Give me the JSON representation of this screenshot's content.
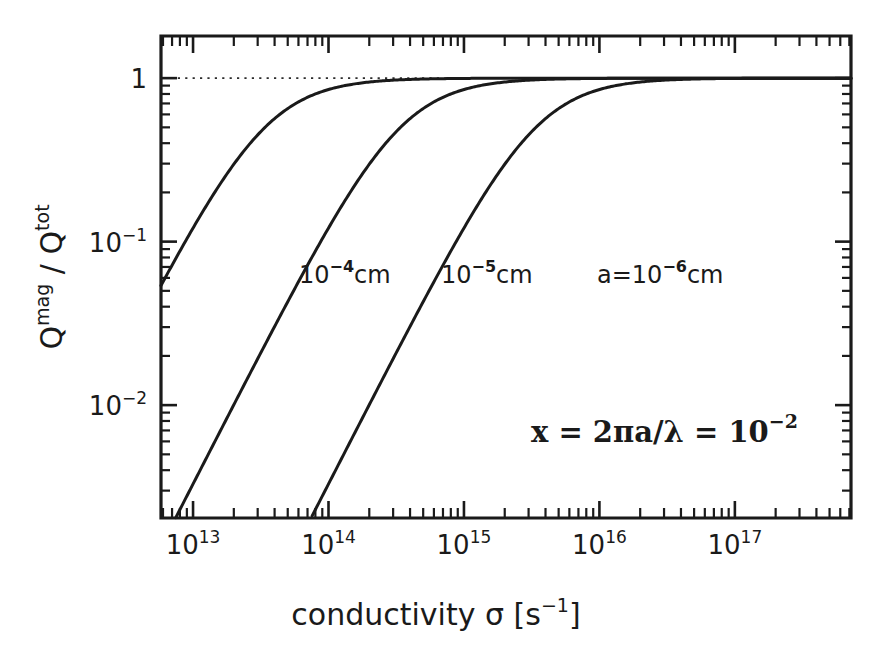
{
  "figure": {
    "background_color": "#ffffff",
    "ink_color": "#1a1a1a"
  },
  "chart_data": {
    "type": "line",
    "title": "",
    "subtitle": "",
    "xlabel": "conductivity σ [s⁻¹]",
    "ylabel": "Qᵐᵃᵍ/Qᵗᵒᵗ",
    "xscale": "log",
    "yscale": "log",
    "xlim": [
      5800000000000.0,
      7.2e+17
    ],
    "ylim": [
      0.00204,
      1.81
    ],
    "grid": false,
    "legend": "inline-curve-labels",
    "x_tick_labels": [
      "10¹³",
      "10¹⁴",
      "10¹⁵",
      "10¹⁶",
      "10¹⁷"
    ],
    "x_tick_values": [
      10000000000000.0,
      100000000000000.0,
      1000000000000000.0,
      1e+16,
      1e+17
    ],
    "y_tick_labels": [
      "1",
      "10⁻¹",
      "10⁻²"
    ],
    "y_tick_values": [
      1,
      0.1,
      0.01
    ],
    "annotations": [
      {
        "name": "unity-asymptote",
        "text": "",
        "style": "dotted-horizontal-line",
        "y": 1
      }
    ],
    "series": [
      {
        "name": "a = 10^-4 cm",
        "label": "10⁻⁴cm",
        "label_base": "10",
        "label_exponent": "-4",
        "label_unit": "cm",
        "sigma_half": 34000000000000.0,
        "x_at_ymin": 10000000000000.0,
        "color": "#1a1a1a"
      },
      {
        "name": "a = 10^-5 cm",
        "label": "10⁻⁵cm",
        "label_base": "10",
        "label_exponent": "-5",
        "label_unit": "cm",
        "sigma_half": 340000000000000.0,
        "x_at_ymin": 100000000000000.0,
        "color": "#1a1a1a"
      },
      {
        "name": "a = 10^-6 cm",
        "label": "a=10⁻⁶cm",
        "label_prefix": "a=",
        "label_base": "10",
        "label_exponent": "-6",
        "label_unit": "cm",
        "sigma_half": 3400000000000000.0,
        "x_at_ymin": 1000000000000000.0,
        "color": "#1a1a1a"
      }
    ]
  },
  "axes": {
    "x_title": {
      "text_before": "conductivity σ [s",
      "exponent": "−1",
      "text_after": "]"
    },
    "y_title": {
      "q1": "Q",
      "sup1": "mag",
      "slash": "/",
      "q2": "Q",
      "sup2": "tot"
    },
    "x_ticks": [
      {
        "base": "10",
        "exp": "13"
      },
      {
        "base": "10",
        "exp": "14"
      },
      {
        "base": "10",
        "exp": "15"
      },
      {
        "base": "10",
        "exp": "16"
      },
      {
        "base": "10",
        "exp": "17"
      }
    ],
    "y_ticks": [
      {
        "base": "1",
        "exp": ""
      },
      {
        "base": "10",
        "exp": "−1"
      },
      {
        "base": "10",
        "exp": "−2"
      }
    ]
  },
  "curve_labels": [
    {
      "name": "label-1e-4",
      "base": "10",
      "exp": "−4",
      "unit": "cm",
      "prefix": ""
    },
    {
      "name": "label-1e-5",
      "base": "10",
      "exp": "−5",
      "unit": "cm",
      "prefix": ""
    },
    {
      "name": "label-1e-6",
      "base": "10",
      "exp": "−6",
      "unit": "cm",
      "prefix": "a="
    }
  ],
  "annotation": {
    "lhs": "x  =  2πa/λ  =  10",
    "exp": "−2"
  }
}
